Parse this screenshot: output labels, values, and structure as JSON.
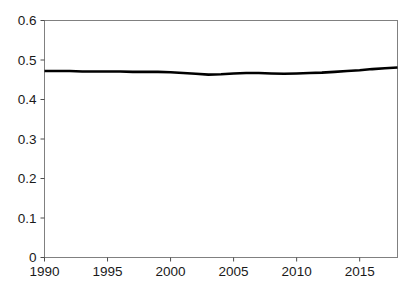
{
  "chart_data": {
    "type": "line",
    "title": "",
    "subtitle": "",
    "xlabel": "",
    "ylabel": "",
    "xlim": [
      1990,
      2018
    ],
    "ylim": [
      0,
      0.6
    ],
    "grid": false,
    "legend": false,
    "legend_position": "none",
    "y_ticks": [
      0,
      0.1,
      0.2,
      0.3,
      0.4,
      0.5,
      0.6
    ],
    "y_tick_labels": [
      "0",
      "0.1",
      "0.2",
      "0.3",
      "0.4",
      "0.5",
      "0.6"
    ],
    "x_ticks": [
      1990,
      1995,
      2000,
      2005,
      2010,
      2015
    ],
    "x_tick_labels": [
      "1990",
      "1995",
      "2000",
      "2005",
      "2010",
      "2015"
    ],
    "line_color": "#000000",
    "background_color": "#ffffff",
    "frame_color": "#808080",
    "series": [
      {
        "name": "series-1",
        "color": "#000000",
        "x": [
          1990,
          1991,
          1992,
          1993,
          1994,
          1995,
          1996,
          1997,
          1998,
          1999,
          2000,
          2001,
          2002,
          2003,
          2004,
          2005,
          2006,
          2007,
          2008,
          2009,
          2010,
          2011,
          2012,
          2013,
          2014,
          2015,
          2016,
          2017,
          2018
        ],
        "values": [
          0.472,
          0.472,
          0.472,
          0.471,
          0.471,
          0.471,
          0.471,
          0.47,
          0.47,
          0.47,
          0.469,
          0.467,
          0.465,
          0.463,
          0.464,
          0.466,
          0.467,
          0.467,
          0.466,
          0.465,
          0.466,
          0.467,
          0.468,
          0.47,
          0.472,
          0.474,
          0.477,
          0.479,
          0.481
        ]
      }
    ]
  }
}
